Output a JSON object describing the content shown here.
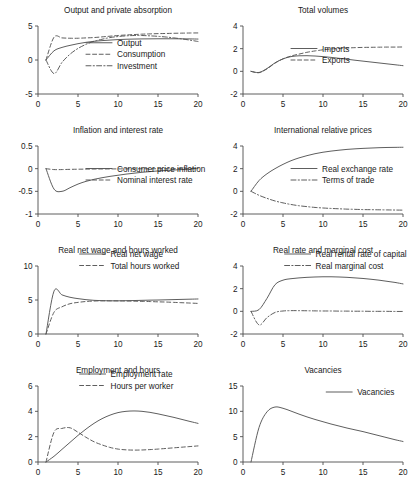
{
  "figure": {
    "background": "#ffffff",
    "line_color": "#555555",
    "axis_color": "#4d4d4d",
    "columns": 2,
    "rows": 4
  },
  "chart_data": [
    {
      "type": "line",
      "title": "Output and private absorption",
      "xlabel": "",
      "ylabel": "",
      "xlim": [
        0,
        20
      ],
      "ylim": [
        -5,
        5
      ],
      "xticks": [
        0,
        5,
        10,
        15,
        20
      ],
      "yticks": [
        -5,
        0,
        5
      ],
      "xticklabels": [
        "0",
        "5",
        "10",
        "15",
        "20"
      ],
      "yticklabels": [
        "-5",
        "0",
        "5"
      ],
      "grid": false,
      "legend_position": "center",
      "x": [
        1,
        2,
        3,
        4,
        5,
        6,
        7,
        8,
        9,
        10,
        11,
        12,
        13,
        14,
        15,
        16,
        17,
        18,
        19,
        20
      ],
      "series": [
        {
          "name": "Output",
          "style": "solid",
          "values": [
            0.0,
            1.35,
            1.85,
            2.15,
            2.4,
            2.6,
            2.75,
            2.85,
            2.93,
            3.0,
            3.05,
            3.08,
            3.1,
            3.11,
            3.12,
            3.12,
            3.12,
            3.11,
            3.1,
            3.08
          ]
        },
        {
          "name": "Consumption",
          "style": "dashed",
          "values": [
            0.0,
            3.35,
            3.25,
            3.2,
            3.2,
            3.25,
            3.3,
            3.4,
            3.5,
            3.6,
            3.68,
            3.74,
            3.8,
            3.84,
            3.88,
            3.9,
            3.93,
            3.95,
            3.97,
            3.98
          ]
        },
        {
          "name": "Investment",
          "style": "dashdot",
          "values": [
            0.0,
            -2.0,
            -0.35,
            0.85,
            1.7,
            2.3,
            2.75,
            3.05,
            3.3,
            3.45,
            3.55,
            3.6,
            3.6,
            3.55,
            3.48,
            3.38,
            3.25,
            3.1,
            2.92,
            2.72
          ]
        }
      ]
    },
    {
      "type": "line",
      "title": "Total volumes",
      "xlabel": "",
      "ylabel": "",
      "xlim": [
        0,
        20
      ],
      "ylim": [
        -2,
        4
      ],
      "xticks": [
        0,
        5,
        10,
        15,
        20
      ],
      "yticks": [
        -2,
        0,
        2,
        4
      ],
      "xticklabels": [
        "0",
        "5",
        "10",
        "15",
        "20"
      ],
      "yticklabels": [
        "-2",
        "0",
        "2",
        "4"
      ],
      "grid": false,
      "legend_position": "center",
      "x": [
        1,
        2,
        3,
        4,
        5,
        6,
        7,
        8,
        9,
        10,
        11,
        12,
        13,
        14,
        15,
        16,
        17,
        18,
        19,
        20
      ],
      "series": [
        {
          "name": "Imports",
          "style": "solid",
          "values": [
            0.0,
            -0.1,
            0.25,
            0.75,
            1.1,
            1.3,
            1.37,
            1.38,
            1.35,
            1.3,
            1.23,
            1.15,
            1.07,
            0.98,
            0.9,
            0.82,
            0.74,
            0.66,
            0.58,
            0.5
          ]
        },
        {
          "name": "Exports",
          "style": "dashed",
          "values": [
            0.0,
            -0.12,
            0.22,
            0.72,
            1.1,
            1.35,
            1.52,
            1.68,
            1.8,
            1.9,
            1.97,
            2.02,
            2.06,
            2.09,
            2.11,
            2.12,
            2.13,
            2.14,
            2.14,
            2.15
          ]
        }
      ]
    },
    {
      "type": "line",
      "title": "Inflation and interest rate",
      "xlabel": "",
      "ylabel": "",
      "xlim": [
        0,
        20
      ],
      "ylim": [
        -1,
        0.5
      ],
      "xticks": [
        0,
        5,
        10,
        15,
        20
      ],
      "yticks": [
        -1,
        -0.5,
        0,
        0.5
      ],
      "xticklabels": [
        "0",
        "5",
        "10",
        "15",
        "20"
      ],
      "yticklabels": [
        "-1",
        "-0.5",
        "0",
        "0.5"
      ],
      "grid": false,
      "legend_position": "center",
      "x": [
        1,
        2,
        3,
        4,
        5,
        6,
        7,
        8,
        9,
        10,
        11,
        12,
        13,
        14,
        15,
        16,
        17,
        18,
        19,
        20
      ],
      "series": [
        {
          "name": "Consumer price inflation",
          "style": "solid",
          "values": [
            0.0,
            -0.45,
            -0.5,
            -0.42,
            -0.34,
            -0.28,
            -0.235,
            -0.2,
            -0.17,
            -0.145,
            -0.12,
            -0.1,
            -0.08,
            -0.065,
            -0.05,
            -0.04,
            -0.03,
            -0.02,
            -0.01,
            0.015
          ]
        },
        {
          "name": "Nominal interest rate",
          "style": "dashed",
          "values": [
            0.0,
            -0.02,
            -0.02,
            -0.015,
            -0.012,
            -0.01,
            -0.008,
            -0.007,
            -0.006,
            -0.005,
            -0.004,
            -0.004,
            -0.003,
            -0.003,
            -0.002,
            -0.002,
            -0.001,
            -0.001,
            0.0,
            0.0
          ]
        }
      ]
    },
    {
      "type": "line",
      "title": "International relative prices",
      "xlabel": "",
      "ylabel": "",
      "xlim": [
        0,
        20
      ],
      "ylim": [
        -2,
        4
      ],
      "xticks": [
        0,
        5,
        10,
        15,
        20
      ],
      "yticks": [
        -2,
        0,
        2,
        4
      ],
      "xticklabels": [
        "0",
        "5",
        "10",
        "15",
        "20"
      ],
      "yticklabels": [
        "-2",
        "0",
        "2",
        "4"
      ],
      "grid": false,
      "legend_position": "center",
      "x": [
        1,
        2,
        3,
        4,
        5,
        6,
        7,
        8,
        9,
        10,
        11,
        12,
        13,
        14,
        15,
        16,
        17,
        18,
        19,
        20
      ],
      "series": [
        {
          "name": "Real exchange rate",
          "style": "solid",
          "values": [
            0.0,
            0.95,
            1.55,
            2.0,
            2.38,
            2.7,
            2.95,
            3.15,
            3.32,
            3.45,
            3.55,
            3.63,
            3.7,
            3.75,
            3.79,
            3.82,
            3.85,
            3.87,
            3.88,
            3.89
          ]
        },
        {
          "name": "Terms of trade",
          "style": "dashdot",
          "values": [
            0.0,
            -0.35,
            -0.62,
            -0.85,
            -1.02,
            -1.16,
            -1.27,
            -1.35,
            -1.42,
            -1.47,
            -1.51,
            -1.54,
            -1.57,
            -1.59,
            -1.61,
            -1.62,
            -1.63,
            -1.64,
            -1.65,
            -1.66
          ]
        }
      ]
    },
    {
      "type": "line",
      "title": "Real net wage and hours worked",
      "xlabel": "",
      "ylabel": "",
      "xlim": [
        0,
        20
      ],
      "ylim": [
        0,
        10
      ],
      "xticks": [
        0,
        5,
        10,
        15,
        20
      ],
      "yticks": [
        0,
        5,
        10
      ],
      "xticklabels": [
        "0",
        "5",
        "10",
        "15",
        "20"
      ],
      "yticklabels": [
        "0",
        "5",
        "10"
      ],
      "grid": false,
      "legend_position": "upper center",
      "x": [
        1,
        2,
        3,
        4,
        5,
        6,
        7,
        8,
        9,
        10,
        11,
        12,
        13,
        14,
        15,
        16,
        17,
        18,
        19,
        20
      ],
      "series": [
        {
          "name": "Real net wage",
          "style": "solid",
          "values": [
            0.0,
            6.3,
            5.75,
            5.4,
            5.2,
            5.05,
            4.95,
            4.9,
            4.88,
            4.88,
            4.9,
            4.92,
            4.95,
            4.98,
            5.0,
            5.03,
            5.06,
            5.09,
            5.12,
            5.15
          ]
        },
        {
          "name": "Total hours worked",
          "style": "dashed",
          "values": [
            0.0,
            3.2,
            4.0,
            4.45,
            4.65,
            4.78,
            4.85,
            4.88,
            4.88,
            4.87,
            4.85,
            4.83,
            4.8,
            4.77,
            4.73,
            4.7,
            4.65,
            4.6,
            4.55,
            4.5
          ]
        }
      ]
    },
    {
      "type": "line",
      "title": "Real rate and marginal cost",
      "xlabel": "",
      "ylabel": "",
      "xlim": [
        0,
        20
      ],
      "ylim": [
        -2,
        4
      ],
      "xticks": [
        0,
        5,
        10,
        15,
        20
      ],
      "yticks": [
        -2,
        0,
        2,
        4
      ],
      "xticklabels": [
        "0",
        "5",
        "10",
        "15",
        "20"
      ],
      "yticklabels": [
        "-2",
        "0",
        "2",
        "4"
      ],
      "grid": false,
      "legend_position": "upper center",
      "x": [
        1,
        2,
        3,
        4,
        5,
        6,
        7,
        8,
        9,
        10,
        11,
        12,
        13,
        14,
        15,
        16,
        17,
        18,
        19,
        20
      ],
      "series": [
        {
          "name": "Real rental rate of capital",
          "style": "solid",
          "values": [
            0.0,
            0.15,
            1.15,
            2.35,
            2.75,
            2.88,
            2.95,
            3.0,
            3.03,
            3.05,
            3.05,
            3.03,
            3.0,
            2.95,
            2.9,
            2.83,
            2.75,
            2.65,
            2.55,
            2.42
          ]
        },
        {
          "name": "Real marginal cost",
          "style": "dashdot",
          "values": [
            0.0,
            -1.2,
            -0.55,
            -0.1,
            0.03,
            0.06,
            0.06,
            0.05,
            0.04,
            0.03,
            0.03,
            0.02,
            0.02,
            0.01,
            0.01,
            0.0,
            0.0,
            0.0,
            -0.01,
            -0.01
          ]
        }
      ]
    },
    {
      "type": "line",
      "title": "Employment and hours",
      "xlabel": "",
      "ylabel": "",
      "xlim": [
        0,
        20
      ],
      "ylim": [
        0,
        6
      ],
      "xticks": [
        0,
        5,
        10,
        15,
        20
      ],
      "yticks": [
        0,
        2,
        4,
        6
      ],
      "xticklabels": [
        "0",
        "5",
        "10",
        "15",
        "20"
      ],
      "yticklabels": [
        "0",
        "2",
        "4",
        "6"
      ],
      "grid": false,
      "legend_position": "upper center",
      "x": [
        1,
        2,
        3,
        4,
        5,
        6,
        7,
        8,
        9,
        10,
        11,
        12,
        13,
        14,
        15,
        16,
        17,
        18,
        19,
        20
      ],
      "series": [
        {
          "name": "Employment rate",
          "style": "solid",
          "values": [
            0.0,
            0.45,
            1.0,
            1.55,
            2.1,
            2.6,
            3.05,
            3.42,
            3.7,
            3.9,
            4.0,
            4.03,
            4.0,
            3.92,
            3.8,
            3.66,
            3.52,
            3.36,
            3.2,
            3.05
          ]
        },
        {
          "name": "Hours per worker",
          "style": "dashed",
          "values": [
            0.0,
            2.35,
            2.65,
            2.7,
            2.35,
            1.95,
            1.6,
            1.35,
            1.15,
            1.02,
            0.96,
            0.94,
            0.95,
            0.98,
            1.02,
            1.07,
            1.12,
            1.17,
            1.22,
            1.27
          ]
        }
      ]
    },
    {
      "type": "line",
      "title": "Vacancies",
      "xlabel": "",
      "ylabel": "",
      "xlim": [
        0,
        20
      ],
      "ylim": [
        0,
        15
      ],
      "xticks": [
        0,
        5,
        10,
        15,
        20
      ],
      "yticks": [
        0,
        5,
        10,
        15
      ],
      "xticklabels": [
        "0",
        "5",
        "10",
        "15",
        "20"
      ],
      "yticklabels": [
        "0",
        "5",
        "10",
        "15"
      ],
      "grid": false,
      "legend_position": "upper right",
      "x": [
        1,
        2,
        3,
        4,
        5,
        6,
        7,
        8,
        9,
        10,
        11,
        12,
        13,
        14,
        15,
        16,
        17,
        18,
        19,
        20
      ],
      "series": [
        {
          "name": "Vacancies",
          "style": "solid",
          "values": [
            0.0,
            6.8,
            9.9,
            10.85,
            10.6,
            10.05,
            9.45,
            8.9,
            8.4,
            7.95,
            7.5,
            7.1,
            6.7,
            6.35,
            6.0,
            5.6,
            5.2,
            4.8,
            4.4,
            4.05
          ]
        }
      ]
    }
  ]
}
